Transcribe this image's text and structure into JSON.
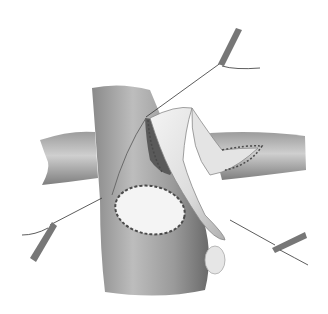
{
  "image": {
    "description": "Grayscale surgical illustration of a vessel repair with sutured patch and stay sutures held by clamps",
    "background": "#ffffff",
    "colors": {
      "vessel_dark": "#6e6e6e",
      "vessel_mid": "#a0a0a0",
      "vessel_light": "#d8d8d8",
      "patch": "#f2f2f2",
      "suture": "#3a3a3a"
    }
  }
}
